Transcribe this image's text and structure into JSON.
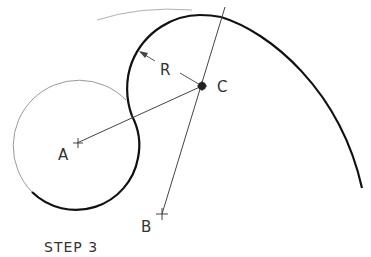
{
  "diagram": {
    "caption": "STEP 3",
    "labels": {
      "A": "A",
      "B": "B",
      "C": "C",
      "R": "R"
    },
    "points": {
      "A": {
        "x": 77,
        "y": 143
      },
      "B": {
        "x": 162,
        "y": 214
      },
      "C": {
        "x": 202,
        "y": 86
      }
    },
    "colors": {
      "thick_line": "#111111",
      "thin_line": "#555555",
      "construction_line": "#aaaaaa",
      "text": "#333333"
    }
  }
}
